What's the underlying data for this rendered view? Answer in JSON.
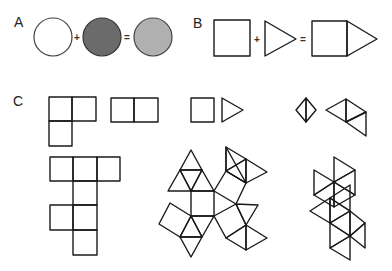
{
  "panels": {
    "a": {
      "label": "A",
      "plus": "+",
      "equals": "=",
      "colors": {
        "circle1": "#ffffff",
        "circle2": "#6b6b6b",
        "circle3": "#b0b0b0",
        "stroke": "#333333"
      }
    },
    "b": {
      "label": "B",
      "plus": "+",
      "equals": "="
    },
    "c": {
      "label": "C"
    }
  }
}
